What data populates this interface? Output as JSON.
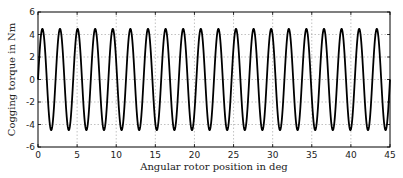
{
  "chart_data": {
    "type": "line",
    "title": "",
    "xlabel": "Angular rotor position in deg",
    "ylabel": "Cogging torque in Nm",
    "xlim": [
      0,
      45
    ],
    "ylim": [
      -6,
      6
    ],
    "xticks": [
      0,
      5,
      10,
      15,
      20,
      25,
      30,
      35,
      40,
      45
    ],
    "yticks": [
      -6,
      -4,
      -2,
      0,
      2,
      4,
      6
    ],
    "grid": true,
    "legend": null,
    "series": [
      {
        "name": "Cogging torque",
        "function": "4.5*sin(2*pi*x/2.25)",
        "amplitude": 4.5,
        "period_deg": 2.25,
        "periods": 20,
        "color": "#000000"
      }
    ]
  },
  "layout": {
    "plot": {
      "left": 38,
      "top": 12,
      "right": 390,
      "bottom": 147
    }
  }
}
